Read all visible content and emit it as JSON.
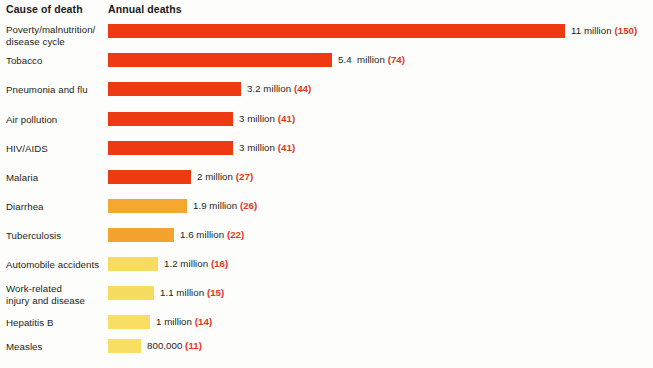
{
  "header": {
    "cause_label": "Cause of death",
    "annual_label": "Annual deaths"
  },
  "chart_data": {
    "type": "bar",
    "title": "",
    "xlabel": "Annual deaths",
    "ylabel": "Cause of death",
    "orientation": "horizontal",
    "grid": false,
    "legend": "none",
    "xlim": [
      0,
      11
    ],
    "unit": "millions of deaths per year",
    "categories": [
      "Poverty/malnutrition/\ndisease cycle",
      "Tobacco",
      "Pneumonia and flu",
      "Air pollution",
      "HIV/AIDS",
      "Malaria",
      "Diarrhea",
      "Tuberculosis",
      "Automobile accidents",
      "Work-related\ninjury and disease",
      "Hepatitis B",
      "Measles"
    ],
    "values": [
      11,
      5.4,
      3.2,
      3,
      3,
      2,
      1.9,
      1.6,
      1.2,
      1.1,
      1,
      0.8
    ],
    "value_labels": [
      "11 million ",
      "5.4  million ",
      "3.2 million ",
      "3 million ",
      "3 million ",
      "2 million ",
      "1.9 million ",
      "1.6 million ",
      "1.2 million ",
      "1.1 million ",
      "1 million ",
      "800,000 "
    ],
    "secondary_labels": [
      "(150)",
      "(74)",
      "(44)",
      "(41)",
      "(41)",
      "(27)",
      "(26)",
      "(22)",
      "(16)",
      "(15)",
      "(14)",
      "(11)"
    ],
    "bar_colors": [
      "#ee3a12",
      "#ee3a12",
      "#ee3a12",
      "#ee3a12",
      "#ee3a12",
      "#ee3a12",
      "#f5a830",
      "#f5a330",
      "#f8dc60",
      "#f8dc60",
      "#f8de62",
      "#f8de62"
    ]
  },
  "colors": {
    "red": "#ee3a12",
    "orange": "#f5a830",
    "yellow": "#f8dc60",
    "rank_text": "#e8331c",
    "body_text": "#231f20",
    "background": "#fdfdfc"
  }
}
